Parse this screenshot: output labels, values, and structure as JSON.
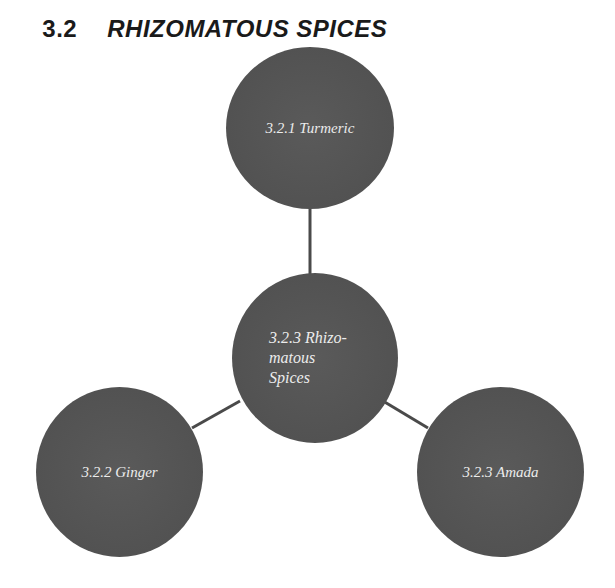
{
  "heading": {
    "number": "3.2",
    "title": "RHIZOMATOUS SPICES"
  },
  "diagram": {
    "center": {
      "label": "3.2.3 Rhizo-\nmatous\nSpices"
    },
    "nodes": [
      {
        "id": "turmeric",
        "label": "3.2.1 Turmeric"
      },
      {
        "id": "ginger",
        "label": "3.2.2 Ginger"
      },
      {
        "id": "amada",
        "label": "3.2.3 Amada"
      }
    ],
    "colors": {
      "node_fill": "#545454",
      "node_text": "#ececec",
      "connector": "#4a4a4a",
      "background": "#ffffff"
    }
  }
}
